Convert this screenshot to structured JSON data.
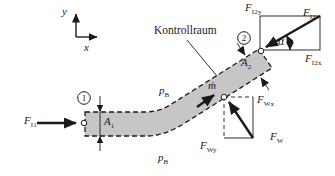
{
  "figure": {
    "background": "#ffffff",
    "pipe_fill": "#c6c6c6",
    "ink": "#1a1a1a"
  },
  "axes": {
    "x_label": "x",
    "y_label": "y"
  },
  "labels": {
    "kontrollraum": "Kontrollraum",
    "alpha": "α",
    "m_dot": "ṁ",
    "section_1": "1",
    "section_2": "2",
    "p_top": {
      "main": "p",
      "sub": "B"
    },
    "p_bottom": {
      "main": "p",
      "sub": "B"
    },
    "area_1": {
      "main": "A",
      "sub": "1"
    },
    "area_2": {
      "main": "A",
      "sub": "2"
    },
    "F_I1": {
      "main": "F",
      "sub": "I1"
    },
    "F_I2": {
      "main": "F",
      "sub": "I2"
    },
    "F_I2x": {
      "main": "F",
      "sub": "I2x"
    },
    "F_I2y": {
      "main": "F",
      "sub": "I2y"
    },
    "F_W": {
      "main": "F",
      "sub": "W"
    },
    "F_Wx": {
      "main": "F",
      "sub": "Wx"
    },
    "F_Wy": {
      "main": "F",
      "sub": "Wy"
    }
  }
}
